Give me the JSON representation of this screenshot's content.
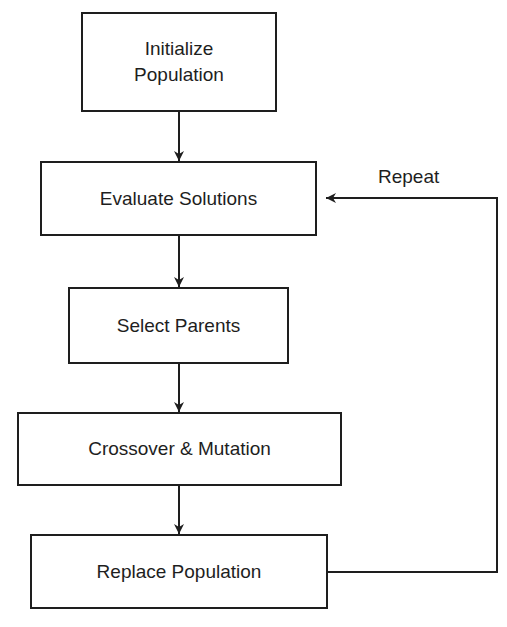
{
  "diagram": {
    "type": "flowchart",
    "steps": [
      {
        "id": "init",
        "line1": "Initialize",
        "line2": "Population"
      },
      {
        "id": "evaluate",
        "label": "Evaluate Solutions"
      },
      {
        "id": "select",
        "label": "Select Parents"
      },
      {
        "id": "crossover",
        "label": "Crossover & Mutation"
      },
      {
        "id": "replace",
        "label": "Replace Population"
      }
    ],
    "edges": [
      {
        "from": "init",
        "to": "evaluate"
      },
      {
        "from": "evaluate",
        "to": "select"
      },
      {
        "from": "select",
        "to": "crossover"
      },
      {
        "from": "crossover",
        "to": "replace"
      },
      {
        "from": "replace",
        "to": "evaluate",
        "label": "Repeat"
      }
    ],
    "loop_label": "Repeat",
    "colors": {
      "stroke": "#1e1e1e",
      "background": "#ffffff",
      "text": "#1e1e1e"
    }
  }
}
